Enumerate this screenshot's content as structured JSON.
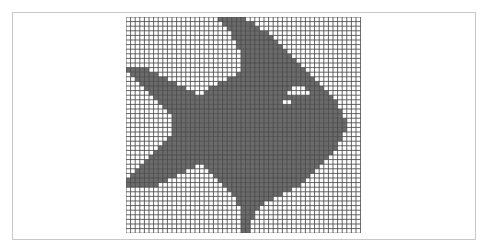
{
  "canvas": {
    "title": "Pixel art fish on grid",
    "cell_px": 4.6,
    "cols": 51,
    "rows": 47,
    "colors": {
      "background": "#ffffff",
      "frame_border": "#c8c8c8",
      "grid_line": "#4a4a4a",
      "fill": "#6b6b6b",
      "empty": "#ffffff"
    }
  },
  "fish": {
    "description": "Filled cells per row as [startCol, endCol] inclusive spans",
    "rows": [
      [
        [
          20,
          25
        ]
      ],
      [
        [
          21,
          27
        ]
      ],
      [
        [
          22,
          28
        ]
      ],
      [
        [
          23,
          30
        ]
      ],
      [
        [
          23,
          31
        ]
      ],
      [
        [
          24,
          32
        ]
      ],
      [
        [
          24,
          33
        ]
      ],
      [
        [
          25,
          34
        ]
      ],
      [
        [
          25,
          35
        ]
      ],
      [
        [
          25,
          36
        ]
      ],
      [
        [
          25,
          37
        ]
      ],
      [
        [
          0,
          4
        ],
        [
          25,
          38
        ]
      ],
      [
        [
          1,
          6
        ],
        [
          24,
          39
        ]
      ],
      [
        [
          2,
          8
        ],
        [
          22,
          40
        ]
      ],
      [
        [
          3,
          10
        ],
        [
          20,
          41
        ]
      ],
      [
        [
          4,
          12
        ],
        [
          18,
          35
        ],
        [
          39,
          42
        ]
      ],
      [
        [
          5,
          14
        ],
        [
          17,
          34
        ],
        [
          40,
          43
        ]
      ],
      [
        [
          6,
          44
        ]
      ],
      [
        [
          7,
          33
        ],
        [
          36,
          45
        ]
      ],
      [
        [
          8,
          45
        ]
      ],
      [
        [
          9,
          46
        ]
      ],
      [
        [
          10,
          46
        ]
      ],
      [
        [
          10,
          47
        ]
      ],
      [
        [
          10,
          47
        ]
      ],
      [
        [
          10,
          47
        ]
      ],
      [
        [
          10,
          46
        ]
      ],
      [
        [
          9,
          46
        ]
      ],
      [
        [
          8,
          45
        ]
      ],
      [
        [
          7,
          45
        ]
      ],
      [
        [
          6,
          44
        ]
      ],
      [
        [
          5,
          43
        ]
      ],
      [
        [
          4,
          42
        ]
      ],
      [
        [
          3,
          14
        ],
        [
          17,
          41
        ]
      ],
      [
        [
          2,
          12
        ],
        [
          18,
          40
        ]
      ],
      [
        [
          1,
          10
        ],
        [
          19,
          39
        ]
      ],
      [
        [
          0,
          8
        ],
        [
          20,
          38
        ]
      ],
      [
        [
          0,
          6
        ],
        [
          21,
          37
        ]
      ],
      [
        [
          22,
          35
        ]
      ],
      [
        [
          23,
          33
        ]
      ],
      [
        [
          24,
          31
        ]
      ],
      [
        [
          24,
          29
        ]
      ],
      [
        [
          25,
          28
        ]
      ],
      [
        [
          25,
          27
        ]
      ],
      [
        [
          25,
          27
        ]
      ],
      [
        [
          25,
          26
        ]
      ],
      [
        [
          25,
          26
        ]
      ],
      [
        [
          25,
          26
        ]
      ]
    ]
  }
}
